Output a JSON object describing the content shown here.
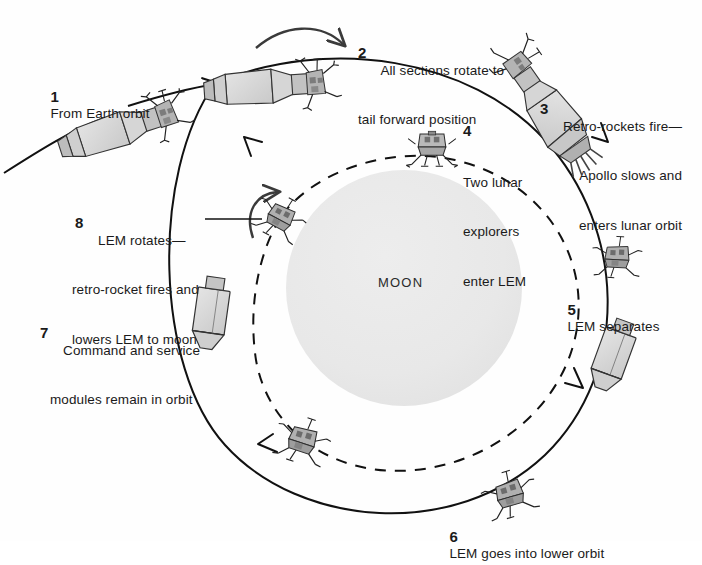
{
  "diagram": {
    "moon_label": "MOON",
    "colors": {
      "stroke": "#111111",
      "moon_fill": "#e9e9e9",
      "craft_light": "#dcdcdc",
      "craft_mid": "#bdbdbd",
      "craft_dark": "#8f8f8f",
      "text": "#1a1a1a",
      "background": "#ffffff"
    },
    "steps": [
      {
        "id": 1,
        "number": "1",
        "lines": [
          "From Earth orbit"
        ]
      },
      {
        "id": 2,
        "number": "2",
        "lines": [
          "All sections rotate to",
          "tail forward position"
        ]
      },
      {
        "id": 3,
        "number": "3",
        "lines": [
          "Retro-rockets fire—",
          "Apollo slows and",
          "enters lunar orbit"
        ]
      },
      {
        "id": 4,
        "number": "4",
        "lines": [
          "Two lunar",
          "explorers",
          "enter LEM"
        ]
      },
      {
        "id": 5,
        "number": "5",
        "lines": [
          "LEM separates"
        ]
      },
      {
        "id": 6,
        "number": "6",
        "lines": [
          "LEM goes into lower orbit"
        ]
      },
      {
        "id": 7,
        "number": "7",
        "lines": [
          "Command and service",
          "modules remain in orbit"
        ]
      },
      {
        "id": 8,
        "number": "8",
        "lines": [
          "LEM rotates—",
          "retro-rocket fires and",
          "lowers LEM to moon"
        ]
      }
    ],
    "step_text": {
      "s1_l1": "From Earth orbit",
      "s2_l1": "All sections rotate to",
      "s2_l2": "tail forward position",
      "s3_l1": "Retro-rockets fire—",
      "s3_l2": "Apollo slows and",
      "s3_l3": "enters lunar orbit",
      "s4_l1": "Two lunar",
      "s4_l2": "explorers",
      "s4_l3": "enter LEM",
      "s5_l1": "LEM separates",
      "s6_l1": "LEM goes into lower orbit",
      "s7_l1": "Command and service",
      "s7_l2": "modules remain in orbit",
      "s8_l1": "LEM rotates—",
      "s8_l2": "retro-rocket fires and",
      "s8_l3": "lowers LEM to moon"
    },
    "numbers": {
      "n1": "1",
      "n2": "2",
      "n3": "3",
      "n4": "4",
      "n5": "5",
      "n6": "6",
      "n7": "7",
      "n8": "8"
    }
  }
}
